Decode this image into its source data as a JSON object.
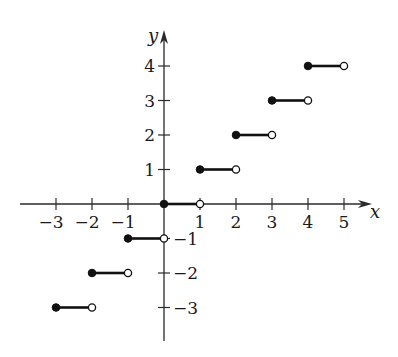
{
  "chart_data": {
    "type": "line",
    "subtype": "step-function",
    "title": "",
    "xlabel": "x",
    "ylabel": "y",
    "xlim": [
      -3.3,
      5.5
    ],
    "ylim": [
      -3.8,
      4.8
    ],
    "grid": false,
    "legend": null,
    "x_ticks": [
      -3,
      -2,
      -1,
      1,
      2,
      3,
      4,
      5
    ],
    "x_tick_labels": [
      "−3",
      "−2",
      "−1",
      "1",
      "2",
      "3",
      "4",
      "5"
    ],
    "y_ticks": [
      4,
      3,
      2,
      1,
      -1,
      -2,
      -3
    ],
    "y_tick_labels": [
      "4",
      "3",
      "2",
      "1",
      "−1",
      "−2",
      "−3"
    ],
    "segments": [
      {
        "x_start": -3,
        "x_end": -2,
        "y": -3,
        "start_closed": true,
        "end_closed": false
      },
      {
        "x_start": -2,
        "x_end": -1,
        "y": -2,
        "start_closed": true,
        "end_closed": false
      },
      {
        "x_start": -1,
        "x_end": 0,
        "y": -1,
        "start_closed": true,
        "end_closed": false
      },
      {
        "x_start": 0,
        "x_end": 1,
        "y": 0,
        "start_closed": true,
        "end_closed": false
      },
      {
        "x_start": 1,
        "x_end": 2,
        "y": 1,
        "start_closed": true,
        "end_closed": false
      },
      {
        "x_start": 2,
        "x_end": 3,
        "y": 2,
        "start_closed": true,
        "end_closed": false
      },
      {
        "x_start": 3,
        "x_end": 4,
        "y": 3,
        "start_closed": true,
        "end_closed": false
      },
      {
        "x_start": 4,
        "x_end": 5,
        "y": 4,
        "start_closed": true,
        "end_closed": false
      }
    ]
  },
  "layout": {
    "origin_px": [
      164,
      204
    ],
    "x_unit_px": 36,
    "y_unit_px": 34.5,
    "x_axis_px": [
      20,
      372
    ],
    "y_axis_px": [
      30,
      341
    ],
    "colors": {
      "axis": "#2a2a2a",
      "segment": "#111111",
      "text": "#1a1a1a",
      "background": "#ffffff"
    }
  }
}
